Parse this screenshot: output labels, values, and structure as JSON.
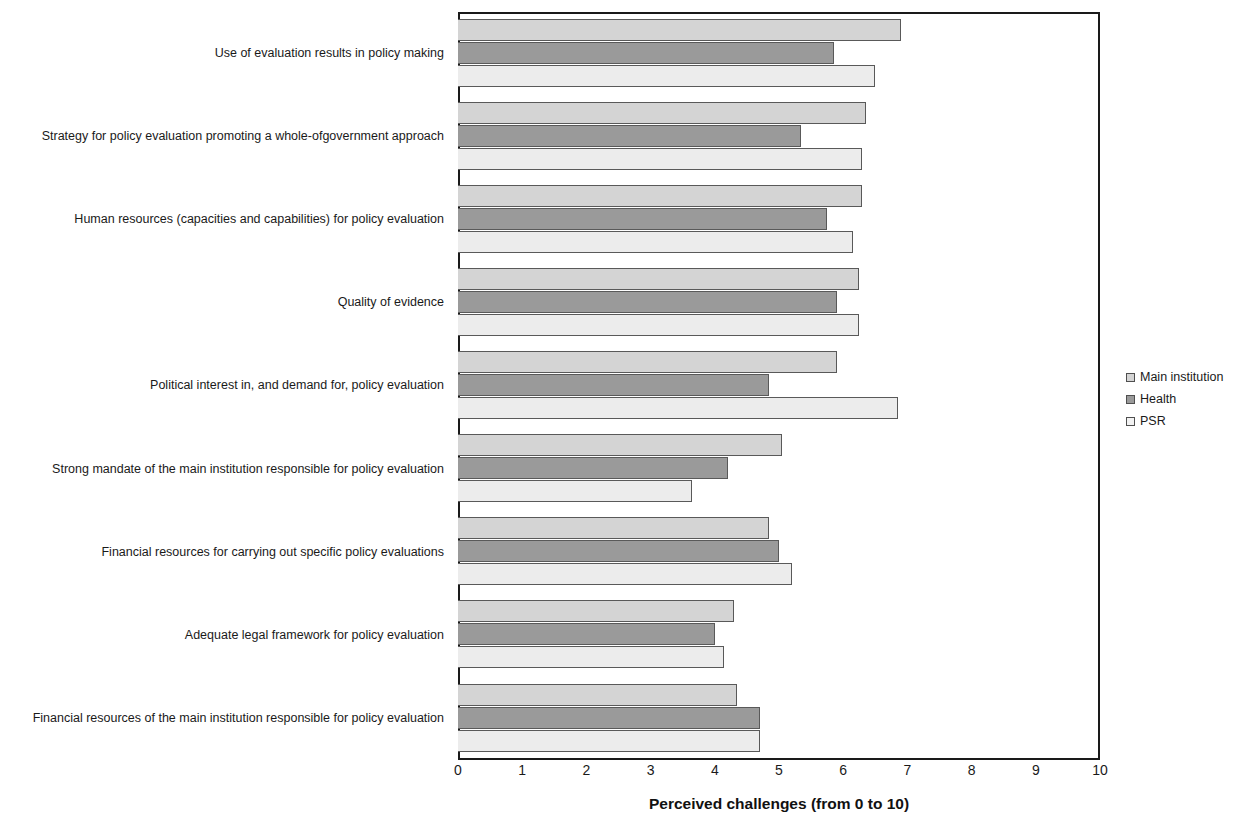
{
  "chart_data": {
    "type": "bar",
    "orientation": "horizontal",
    "title": "",
    "xlabel": "Perceived challenges (from 0 to 10)",
    "ylabel": "",
    "xlim": [
      0,
      10
    ],
    "xticks": [
      "0",
      "1",
      "2",
      "3",
      "4",
      "5",
      "6",
      "7",
      "8",
      "9",
      "10"
    ],
    "grid": false,
    "legend_position": "right",
    "categories": [
      "Use of evaluation results in policy making",
      "Strategy for policy evaluation promoting a whole-ofgovernment approach",
      "Human resources (capacities and capabilities) for policy evaluation",
      "Quality of evidence",
      "Political interest in, and demand for, policy evaluation",
      "Strong mandate of the main institution responsible for policy evaluation",
      "Financial resources for carrying out specific policy evaluations",
      "Adequate legal framework for policy evaluation",
      "Financial resources of the main institution responsible for policy evaluation"
    ],
    "series": [
      {
        "name": "Main institution",
        "color": "#d4d4d4",
        "values": [
          6.9,
          6.35,
          6.3,
          6.25,
          5.9,
          5.05,
          4.85,
          4.3,
          4.35
        ]
      },
      {
        "name": "Health",
        "color": "#9a9a9a",
        "values": [
          5.85,
          5.35,
          5.75,
          5.9,
          4.85,
          4.2,
          5.0,
          4.0,
          4.7
        ]
      },
      {
        "name": "PSR",
        "color": "#ececec",
        "values": [
          6.5,
          6.3,
          6.15,
          6.25,
          6.85,
          3.65,
          5.2,
          4.15,
          4.7
        ]
      }
    ]
  }
}
